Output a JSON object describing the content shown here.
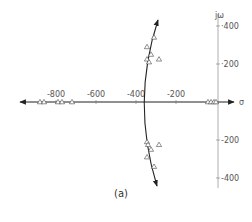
{
  "chart_data": {
    "type": "scatter",
    "title": "",
    "caption": "(a)",
    "xlabel": "σ",
    "ylabel": "jω",
    "xlim": [
      -1000,
      60
    ],
    "ylim": [
      -450,
      450
    ],
    "grid": false,
    "x_ticks": [
      {
        "value": -800,
        "label": "-800"
      },
      {
        "value": -600,
        "label": "-600"
      },
      {
        "value": -400,
        "label": "-400"
      },
      {
        "value": -200,
        "label": "-200"
      }
    ],
    "y_ticks": [
      {
        "value": 400,
        "label": "400"
      },
      {
        "value": 200,
        "label": "200"
      },
      {
        "value": -200,
        "label": "-200"
      },
      {
        "value": -400,
        "label": "-400"
      }
    ],
    "series": [
      {
        "name": "root locus branch (complex)",
        "kind": "curve",
        "points": [
          [
            -295,
            430
          ],
          [
            -330,
            200
          ],
          [
            -360,
            0
          ],
          [
            -330,
            -200
          ],
          [
            -300,
            -430
          ]
        ]
      },
      {
        "name": "real-axis locus",
        "kind": "line",
        "points": [
          [
            -1000,
            0
          ],
          [
            60,
            0
          ]
        ]
      },
      {
        "name": "closed-loop poles (triangles)",
        "kind": "markers",
        "marker": "triangle",
        "points": [
          [
            -880,
            0
          ],
          [
            -860,
            0
          ],
          [
            -790,
            0
          ],
          [
            -770,
            0
          ],
          [
            -720,
            0
          ],
          [
            -40,
            0
          ],
          [
            -25,
            0
          ],
          [
            -10,
            0
          ],
          [
            0,
            0
          ],
          [
            -310,
            340
          ],
          [
            -345,
            290
          ],
          [
            -325,
            250
          ],
          [
            -285,
            225
          ],
          [
            -345,
            225
          ],
          [
            -335,
            210
          ],
          [
            -345,
            -210
          ],
          [
            -340,
            -225
          ],
          [
            -285,
            -225
          ],
          [
            -325,
            -250
          ],
          [
            -345,
            -290
          ],
          [
            -310,
            -340
          ]
        ]
      }
    ]
  }
}
